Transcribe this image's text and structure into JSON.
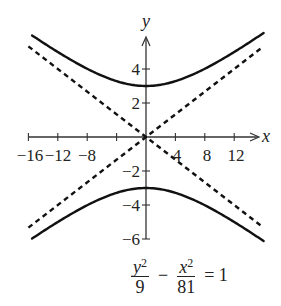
{
  "chart_data": {
    "type": "line",
    "title": "",
    "equation": {
      "term1_num_var": "y",
      "term1_num_exp": "2",
      "term1_den": "9",
      "operator": "−",
      "term2_num_var": "x",
      "term2_num_exp": "2",
      "term2_den": "81",
      "equals": "= 1",
      "text": "y^2/9 - x^2/81 = 1"
    },
    "xlabel": "x",
    "ylabel": "y",
    "xlim": [
      -16,
      16
    ],
    "ylim": [
      -6,
      6
    ],
    "grid": false,
    "x_ticks": [
      -16,
      -12,
      -8,
      -4,
      4,
      8,
      12
    ],
    "x_tick_labels": [
      "−16",
      "−12",
      "−8",
      "4",
      "8",
      "12"
    ],
    "y_ticks": [
      -6,
      -4,
      -2,
      2,
      4
    ],
    "y_tick_labels": [
      "4",
      "2",
      "−2",
      "−4",
      "−6"
    ],
    "series": [
      {
        "name": "hyperbola upper branch",
        "style": "solid",
        "formula": "y = 3*sqrt(1 + x^2/81)",
        "x_range": [
          -15.5,
          16
        ],
        "vertex": [
          0,
          3
        ]
      },
      {
        "name": "hyperbola lower branch",
        "style": "solid",
        "formula": "y = -3*sqrt(1 + x^2/81)",
        "x_range": [
          -15.5,
          16
        ],
        "vertex": [
          0,
          -3
        ]
      },
      {
        "name": "asymptote positive",
        "style": "dashed",
        "formula": "y = x/3",
        "x_range": [
          -16,
          16
        ]
      },
      {
        "name": "asymptote negative",
        "style": "dashed",
        "formula": "y = -x/3",
        "x_range": [
          -16,
          16
        ]
      }
    ]
  },
  "colors": {
    "curve": "#111111",
    "axis": "#333333",
    "background": "#ffffff"
  }
}
